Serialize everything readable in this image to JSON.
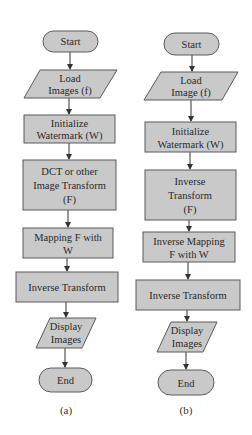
{
  "diagram": {
    "colors": {
      "node_fill": "#c9c9c9",
      "node_stroke": "#5a5a5a",
      "text": "#2a2a2a",
      "arrow": "#333333"
    },
    "flowchart_a": {
      "caption": "(a)",
      "nodes": [
        {
          "id": "start",
          "shape": "terminal",
          "lines": [
            "Start"
          ]
        },
        {
          "id": "load",
          "shape": "parallelogram",
          "lines": [
            "Load",
            "Images (f)"
          ]
        },
        {
          "id": "init",
          "shape": "process",
          "lines": [
            "Initialize",
            "Watermark (W)"
          ]
        },
        {
          "id": "transform",
          "shape": "process",
          "lines": [
            "DCT or other",
            "Image Transform",
            "(F)"
          ]
        },
        {
          "id": "mapping",
          "shape": "process",
          "lines": [
            "Mapping F with",
            "W"
          ]
        },
        {
          "id": "inverse",
          "shape": "process",
          "lines": [
            "Inverse Transform"
          ]
        },
        {
          "id": "display",
          "shape": "parallelogram",
          "lines": [
            "Display",
            "Images"
          ]
        },
        {
          "id": "end",
          "shape": "terminal",
          "lines": [
            "End"
          ]
        }
      ]
    },
    "flowchart_b": {
      "caption": "(b)",
      "nodes": [
        {
          "id": "start",
          "shape": "terminal",
          "lines": [
            "Start"
          ]
        },
        {
          "id": "load",
          "shape": "parallelogram",
          "lines": [
            "Load",
            "Image (f)"
          ]
        },
        {
          "id": "init",
          "shape": "process",
          "lines": [
            "Initialize",
            "Watermark (W)"
          ]
        },
        {
          "id": "transform",
          "shape": "process",
          "lines": [
            "Inverse",
            "Transform",
            "(F)"
          ]
        },
        {
          "id": "mapping",
          "shape": "process",
          "lines": [
            "Inverse Mapping",
            "F with W"
          ]
        },
        {
          "id": "inverse",
          "shape": "process",
          "lines": [
            "Inverse Transform"
          ]
        },
        {
          "id": "display",
          "shape": "parallelogram",
          "lines": [
            "Display",
            "Images"
          ]
        },
        {
          "id": "end",
          "shape": "terminal",
          "lines": [
            "End"
          ]
        }
      ]
    }
  }
}
